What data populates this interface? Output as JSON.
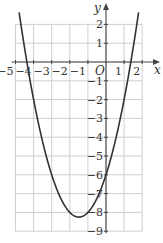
{
  "chart_data": {
    "type": "line",
    "title": "",
    "xlabel": "x",
    "ylabel": "y",
    "origin_label": "O",
    "function": "y = x^2 + 3x - 6",
    "xlim": [
      -5,
      2
    ],
    "ylim": [
      -9,
      2
    ],
    "grid": true,
    "x_ticks": [
      -5,
      -4,
      -3,
      -2,
      -1,
      1,
      2
    ],
    "x_tick_labels": [
      "−5",
      "−4",
      "−3",
      "−2",
      "−1",
      "1",
      "2"
    ],
    "y_ticks": [
      2,
      1,
      -1,
      -2,
      -3,
      -4,
      -5,
      -6,
      -7,
      -8,
      -9
    ],
    "y_tick_labels": [
      "2",
      "1",
      "−1",
      "−2",
      "−3",
      "−4",
      "−5",
      "−6",
      "−7",
      "−8",
      "−9"
    ],
    "series": [
      {
        "name": "parabola",
        "x": [
          -4.92,
          -4.5,
          -4,
          -3.5,
          -3,
          -2.5,
          -2,
          -1.5,
          -1,
          -0.5,
          0,
          0.5,
          1,
          1.5,
          1.9
        ],
        "y": [
          3.45,
          0.75,
          -2,
          -4.25,
          -6,
          -7.25,
          -8,
          -8.25,
          -8,
          -7.25,
          -6,
          -4.25,
          -2,
          0.75,
          3.31
        ]
      }
    ],
    "key_points": {
      "vertex": [
        -1.5,
        -8.25
      ],
      "roots": [
        -4.37,
        1.37
      ],
      "y_intercept": -6
    }
  }
}
